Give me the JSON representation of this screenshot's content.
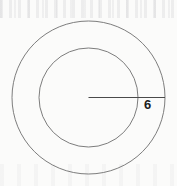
{
  "figure": {
    "kind": "geometry-diagram",
    "background_color": "#fbfbfa",
    "width": 177,
    "height": 186
  },
  "shapes": {
    "outer_circle": {
      "name": "outer-circle",
      "center_x": 88.5,
      "center_y": 97.5,
      "radius": 76.5,
      "stroke_color": "#6e6e6e",
      "stroke_width": 0.9,
      "fill": "none"
    },
    "inner_circle": {
      "name": "inner-circle",
      "center_x": 88.5,
      "center_y": 97.5,
      "radius": 49.5,
      "stroke_color": "#6e6e6e",
      "stroke_width": 0.9,
      "fill": "none"
    },
    "radius_segment": {
      "name": "radius-segment",
      "x1": 88.5,
      "y1": 97.5,
      "x2": 165.0,
      "y2": 97.5,
      "stroke_color": "#4a4a4a",
      "stroke_width": 1.0
    }
  },
  "labels": {
    "radius_measure": {
      "text": "6",
      "color": "#1d1d1d",
      "font_size_px": 13,
      "x": 144,
      "y": 98
    }
  }
}
